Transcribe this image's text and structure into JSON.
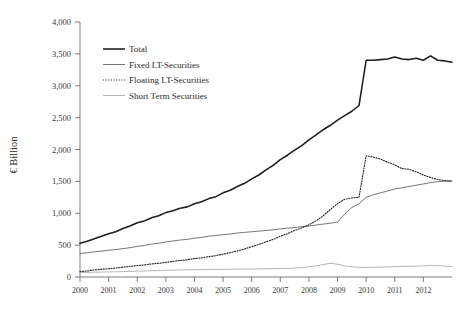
{
  "chart_data": {
    "type": "line",
    "title": "",
    "xlabel": "",
    "ylabel": "€ Billion",
    "xlim": [
      2000,
      2013.0
    ],
    "ylim": [
      0,
      4000
    ],
    "grid": false,
    "legend_position": "top-left-inside",
    "ytick_labels": [
      "0",
      "500",
      "1,000",
      "1,500",
      "2,000",
      "2,500",
      "3,000",
      "3,500",
      "4,000"
    ],
    "ytick_values": [
      0,
      500,
      1000,
      1500,
      2000,
      2500,
      3000,
      3500,
      4000
    ],
    "xtick_labels": [
      "2000",
      "2001",
      "2002",
      "2003",
      "2004",
      "2005",
      "2006",
      "2007",
      "2008",
      "2009",
      "2010",
      "2011",
      "2012"
    ],
    "xtick_values": [
      2000,
      2001,
      2002,
      2003,
      2004,
      2005,
      2006,
      2007,
      2008,
      2009,
      2010,
      2011,
      2012
    ],
    "x": [
      2000.0,
      2000.25,
      2000.5,
      2000.75,
      2001.0,
      2001.25,
      2001.5,
      2001.75,
      2002.0,
      2002.25,
      2002.5,
      2002.75,
      2003.0,
      2003.25,
      2003.5,
      2003.75,
      2004.0,
      2004.25,
      2004.5,
      2004.75,
      2005.0,
      2005.25,
      2005.5,
      2005.75,
      2006.0,
      2006.25,
      2006.5,
      2006.75,
      2007.0,
      2007.25,
      2007.5,
      2007.75,
      2008.0,
      2008.25,
      2008.5,
      2008.75,
      2009.0,
      2009.25,
      2009.5,
      2009.75,
      2010.0,
      2010.25,
      2010.5,
      2010.75,
      2011.0,
      2011.25,
      2011.5,
      2011.75,
      2012.0,
      2012.25,
      2012.5,
      2012.75,
      2013.0
    ],
    "series": [
      {
        "name": "Total",
        "style": "solid-thick",
        "color": "#1d1d1d",
        "values": [
          530,
          560,
          600,
          640,
          680,
          710,
          760,
          800,
          850,
          880,
          930,
          960,
          1010,
          1040,
          1080,
          1100,
          1150,
          1180,
          1230,
          1260,
          1320,
          1360,
          1420,
          1470,
          1540,
          1600,
          1680,
          1750,
          1840,
          1910,
          1990,
          2060,
          2150,
          2230,
          2310,
          2380,
          2460,
          2530,
          2600,
          2690,
          3400,
          3400,
          3410,
          3420,
          3450,
          3420,
          3410,
          3430,
          3400,
          3470,
          3400,
          3390,
          3370
        ]
      },
      {
        "name": "Fixed LT-Securities",
        "style": "solid-thin",
        "color": "#5d5d5d",
        "values": [
          370,
          380,
          395,
          405,
          420,
          430,
          445,
          460,
          480,
          495,
          515,
          530,
          550,
          565,
          580,
          590,
          610,
          620,
          640,
          650,
          665,
          675,
          690,
          700,
          710,
          720,
          730,
          740,
          755,
          765,
          775,
          790,
          800,
          815,
          830,
          845,
          860,
          990,
          1090,
          1150,
          1250,
          1290,
          1320,
          1350,
          1380,
          1400,
          1420,
          1440,
          1460,
          1480,
          1495,
          1505,
          1510
        ]
      },
      {
        "name": "Floating LT-Securities",
        "style": "dotted",
        "color": "#2b2b2b",
        "values": [
          85,
          95,
          110,
          120,
          130,
          140,
          155,
          165,
          180,
          190,
          205,
          215,
          230,
          245,
          260,
          270,
          290,
          300,
          320,
          335,
          360,
          380,
          410,
          440,
          475,
          510,
          550,
          590,
          640,
          680,
          730,
          770,
          820,
          880,
          960,
          1060,
          1150,
          1220,
          1240,
          1250,
          1900,
          1880,
          1850,
          1800,
          1760,
          1700,
          1690,
          1650,
          1600,
          1560,
          1530,
          1510,
          1500
        ]
      },
      {
        "name": "Short Term Securities",
        "style": "solid-light",
        "color": "#a8a8a8",
        "values": [
          70,
          72,
          75,
          78,
          80,
          82,
          85,
          88,
          92,
          95,
          98,
          100,
          105,
          108,
          110,
          112,
          115,
          116,
          118,
          120,
          120,
          122,
          124,
          125,
          126,
          127,
          128,
          130,
          132,
          135,
          140,
          148,
          160,
          175,
          195,
          215,
          200,
          175,
          160,
          152,
          150,
          152,
          155,
          158,
          162,
          165,
          168,
          170,
          175,
          180,
          178,
          172,
          165
        ]
      }
    ]
  },
  "legend": {
    "items": [
      {
        "label": "Total",
        "key": "total"
      },
      {
        "label": "Fixed LT-Securities",
        "key": "fixed"
      },
      {
        "label": "Floating LT-Securities",
        "key": "floating"
      },
      {
        "label": "Short Term Securities",
        "key": "short"
      }
    ]
  }
}
